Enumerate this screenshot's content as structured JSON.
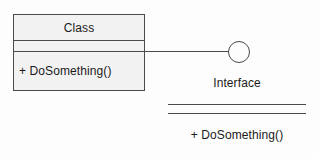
{
  "diagram": {
    "background_color": "#fdfdfd",
    "line_color": "#4a4a4a",
    "text_color": "#1b1b1b",
    "class_box": {
      "fill_color": "#f2f2f2",
      "name": "Class",
      "attributes": [],
      "operations": [
        "+ DoSomething()"
      ]
    },
    "connector": {
      "kind": "lollipop-ball-connector",
      "ball_label": "provided-interface-ball"
    },
    "interface": {
      "name": "Interface",
      "attributes": [],
      "operations": [
        "+ DoSomething()"
      ]
    }
  }
}
